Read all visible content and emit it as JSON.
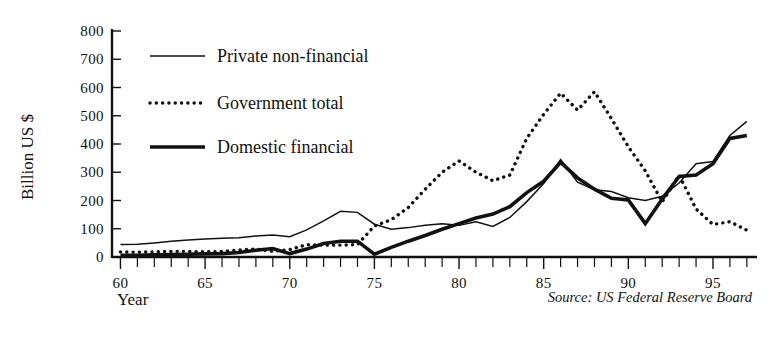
{
  "chart_data": {
    "type": "line",
    "title": "",
    "subtitle": "",
    "xlabel": "Year",
    "ylabel": "Billion US $",
    "xlim": [
      59.5,
      97.6
    ],
    "ylim": [
      0,
      800
    ],
    "grid": false,
    "legend_position": "upper-left-inside",
    "y_ticks": [
      0,
      100,
      200,
      300,
      400,
      500,
      600,
      700,
      800
    ],
    "y_tick_labels": [
      "0",
      "100",
      "200",
      "300",
      "400",
      "500",
      "600",
      "700",
      "800"
    ],
    "x_ticks": [
      60,
      61,
      62,
      63,
      64,
      65,
      66,
      67,
      68,
      69,
      70,
      71,
      72,
      73,
      74,
      75,
      76,
      77,
      78,
      79,
      80,
      81,
      82,
      83,
      84,
      85,
      86,
      87,
      88,
      89,
      90,
      91,
      92,
      93,
      94,
      95,
      96,
      97
    ],
    "x_tick_labels_shown": [
      "60",
      "65",
      "70",
      "75",
      "80",
      "85",
      "90",
      "95"
    ],
    "x_labeled_ticks": [
      60,
      65,
      70,
      75,
      80,
      85,
      90,
      95
    ],
    "x": [
      60,
      61,
      62,
      63,
      64,
      65,
      66,
      67,
      68,
      69,
      70,
      71,
      72,
      73,
      74,
      75,
      76,
      77,
      78,
      79,
      80,
      81,
      82,
      83,
      84,
      85,
      86,
      87,
      88,
      89,
      90,
      91,
      92,
      93,
      94,
      95,
      96,
      97
    ],
    "series": [
      {
        "name": "Private non-financial",
        "style": "thin-solid",
        "color": "#111111",
        "values": [
          44,
          45,
          50,
          56,
          60,
          64,
          66,
          68,
          74,
          78,
          72,
          96,
          128,
          162,
          158,
          116,
          98,
          104,
          112,
          118,
          112,
          125,
          108,
          140,
          196,
          260,
          345,
          265,
          238,
          232,
          210,
          200,
          215,
          262,
          330,
          338,
          430,
          480
        ]
      },
      {
        "name": "Government total",
        "style": "dotted",
        "color": "#111111",
        "values": [
          18,
          17,
          18,
          20,
          20,
          18,
          20,
          25,
          28,
          20,
          26,
          44,
          42,
          42,
          44,
          110,
          132,
          175,
          240,
          300,
          340,
          300,
          270,
          290,
          420,
          505,
          580,
          520,
          585,
          490,
          390,
          305,
          195,
          290,
          170,
          115,
          125,
          95
        ]
      },
      {
        "name": "Domestic financial",
        "style": "thick-solid",
        "color": "#111111",
        "values": [
          6,
          6,
          8,
          9,
          10,
          11,
          12,
          16,
          24,
          30,
          12,
          28,
          48,
          56,
          56,
          10,
          34,
          56,
          76,
          98,
          118,
          138,
          152,
          178,
          228,
          268,
          335,
          280,
          240,
          208,
          202,
          118,
          205,
          285,
          290,
          330,
          420,
          430
        ]
      }
    ],
    "source_note": "Source: US Federal Reserve Board"
  },
  "legend": {
    "items": [
      {
        "label": "Private non-financial",
        "swatch": "thin-line-swatch"
      },
      {
        "label": "Government total",
        "swatch": "dotted-line-swatch"
      },
      {
        "label": "Domestic financial",
        "swatch": "thick-line-swatch"
      }
    ]
  },
  "axes": {
    "y_title": "Billion US $",
    "x_title": "Year"
  },
  "footer": {
    "source": "Source: US Federal Reserve Board"
  }
}
